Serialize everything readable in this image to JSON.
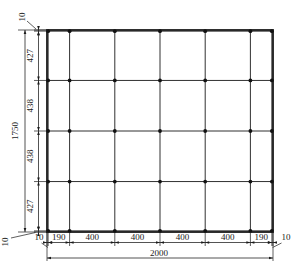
{
  "diagram": {
    "kind": "engineering-dimension-drawing",
    "colors": {
      "line": "#1a1a1a",
      "node": "#111111",
      "background": "#ffffff"
    },
    "plate": {
      "width": 2000,
      "height": 1750
    },
    "grid": {
      "columns": [
        10,
        200,
        600,
        1000,
        1400,
        1800,
        1990
      ],
      "rows": [
        10,
        437,
        875,
        1313,
        1740
      ]
    },
    "dims": {
      "bottom": {
        "ticks": [
          0,
          10,
          200,
          600,
          1000,
          1400,
          1800,
          1990,
          2000
        ],
        "labels": [
          "10",
          "190",
          "400",
          "400",
          "400",
          "400",
          "190",
          "10"
        ],
        "total_label": "2000"
      },
      "left": {
        "ticks": [
          0,
          10,
          437,
          875,
          1313,
          1740,
          1750
        ],
        "labels": [
          "10",
          "427",
          "438",
          "438",
          "427",
          "10"
        ],
        "total_label": "1750"
      }
    }
  }
}
